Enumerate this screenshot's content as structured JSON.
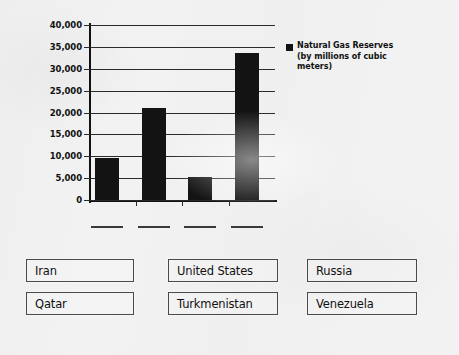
{
  "background_color": "#f2f2f2",
  "chart_data": {
    "type": "bar",
    "title": "",
    "xlabel": "",
    "ylabel": "",
    "categories": [
      "",
      "",
      "",
      ""
    ],
    "values": [
      9600,
      21000,
      5300,
      33700
    ],
    "ylim": [
      0,
      40000
    ],
    "y_ticks": [
      0,
      5000,
      10000,
      15000,
      20000,
      25000,
      30000,
      35000,
      40000
    ],
    "y_tick_labels": [
      "0",
      "5,000",
      "10,000",
      "15,000",
      "20,000",
      "25,000",
      "30,000",
      "35,000",
      "40,000"
    ],
    "grid": true,
    "legend_position": "right",
    "series": [
      {
        "name": "Natural Gas Reserves (by millions of cubic meters)",
        "color": "#131313",
        "values": [
          9600,
          21000,
          5300,
          33700
        ]
      }
    ],
    "bar_color": "#131313",
    "x_category_labels_blank": true
  },
  "legend": {
    "swatch_color": "#131313",
    "line1": "Natural Gas Reserves",
    "line2": "(by millions of cubic",
    "line3": "meters)"
  },
  "answer_blanks": [
    {
      "index": 0,
      "label": ""
    },
    {
      "index": 1,
      "label": ""
    },
    {
      "index": 2,
      "label": ""
    },
    {
      "index": 3,
      "label": ""
    }
  ],
  "answer_bank": {
    "rows": [
      [
        {
          "label": "Iran"
        },
        {
          "label": "United States"
        },
        {
          "label": "Russia"
        }
      ],
      [
        {
          "label": "Qatar"
        },
        {
          "label": "Turkmenistan"
        },
        {
          "label": "Venezuela"
        }
      ]
    ]
  }
}
